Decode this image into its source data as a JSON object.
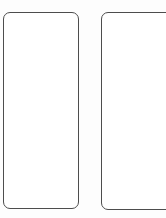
{
  "page": {
    "background_color": "#fdfdfd",
    "width": 166,
    "height": 218
  },
  "style": {
    "card_fill": "#ffffff",
    "card_border_color": "#4d4d4d",
    "card_border_width_px": 1,
    "card_corner_radius_px": 7
  },
  "cards": [
    {
      "id": "card-left",
      "label": "",
      "content": "",
      "state": "empty",
      "clipped": false,
      "x": 3,
      "y": 12,
      "width": 76,
      "height": 197
    },
    {
      "id": "card-right",
      "label": "",
      "content": "",
      "state": "empty",
      "clipped": true,
      "x": 101,
      "y": 12,
      "width": 76,
      "height": 198
    }
  ]
}
